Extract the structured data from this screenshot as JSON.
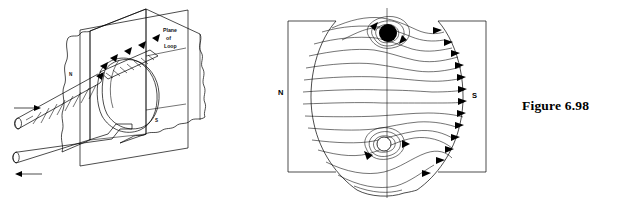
{
  "figure": {
    "caption": "Figure 6.98",
    "panels": [
      {
        "id": "perspective-view",
        "labels": {
          "plane_of_loop_line1": "Plane",
          "plane_of_loop_line2": "of",
          "plane_of_loop_line3": "Loop",
          "north_pole": "N",
          "south_pole": "S"
        },
        "elements": [
          "magnet-pole-face-north",
          "magnet-pole-face-south",
          "plane-of-loop-sheet",
          "current-loop",
          "lead-rod-upper",
          "lead-rod-lower",
          "current-arrow-in",
          "current-arrow-out",
          "field-arrows"
        ]
      },
      {
        "id": "field-line-cross-section",
        "labels": {
          "north_pole": "N",
          "south_pole": "S"
        },
        "elements": [
          "pole-piece-left",
          "pole-piece-right",
          "field-line-bundle",
          "conductor-top-filled",
          "conductor-bottom-hollow",
          "centre-axis",
          "field-direction-arrows"
        ]
      }
    ]
  }
}
